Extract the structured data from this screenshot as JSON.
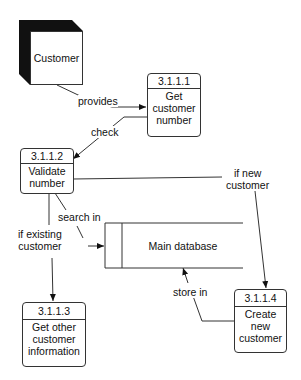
{
  "diagram": {
    "type": "data-flow-diagram",
    "external_entities": [
      {
        "id": "customer",
        "label": "Customer"
      }
    ],
    "processes": [
      {
        "id": "3.1.1.1",
        "number": "3.1.1.1",
        "label": "Get\ncustomer\nnumber"
      },
      {
        "id": "3.1.1.2",
        "number": "3.1.1.2",
        "label": "Validate\nnumber"
      },
      {
        "id": "3.1.1.3",
        "number": "3.1.1.3",
        "label": "Get other\ncustomer\ninformation"
      },
      {
        "id": "3.1.1.4",
        "number": "3.1.1.4",
        "label": "Create\nnew\ncustomer"
      }
    ],
    "data_stores": [
      {
        "id": "main-db",
        "label": "Main database"
      }
    ],
    "flows": [
      {
        "from": "customer",
        "to": "3.1.1.1",
        "label": "provides"
      },
      {
        "from": "3.1.1.1",
        "to": "3.1.1.2",
        "label": "check"
      },
      {
        "from": "3.1.1.2",
        "to": "main-db",
        "label": "search in"
      },
      {
        "from": "3.1.1.2",
        "to": "3.1.1.3",
        "label": "if existing\ncustomer"
      },
      {
        "from": "3.1.1.2",
        "to": "3.1.1.4",
        "label": "if new\ncustomer"
      },
      {
        "from": "3.1.1.4",
        "to": "main-db",
        "label": "store in"
      }
    ]
  },
  "colors": {
    "line": "#333333",
    "shadow": "#111111",
    "background": "#ffffff"
  }
}
